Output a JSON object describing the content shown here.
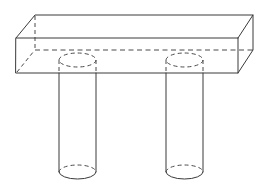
{
  "figure": {
    "type": "orthographic-pictorial-line-drawing",
    "projection": "oblique",
    "background_color": "#ffffff",
    "visible_edge_color": "#3a3a3a",
    "hidden_edge_color": "#4a4a4a",
    "stroke_width": 1,
    "hidden_dash_pattern": "5 3.5",
    "canvas": {
      "width": 264,
      "height": 188
    }
  },
  "geometry": {
    "slab": {
      "name": "rectangular-slab",
      "front_face": {
        "top_left": [
          16,
          38
        ],
        "top_right": [
          238,
          38
        ],
        "bottom_right": [
          238,
          73
        ],
        "bottom_left": [
          16,
          73
        ]
      },
      "depth_offset": [
        19,
        -24
      ],
      "top_face": {
        "front_left": [
          16,
          38
        ],
        "front_right": [
          238,
          38
        ],
        "back_right": [
          253,
          15
        ],
        "back_left": [
          35,
          15
        ]
      },
      "right_end_face": {
        "front_top": [
          238,
          38
        ],
        "back_top": [
          253,
          15
        ],
        "back_bottom": [
          253,
          50
        ],
        "front_bottom": [
          238,
          73
        ]
      },
      "hidden_edges": {
        "back_bottom_horizontal": {
          "from": [
            35,
            50
          ],
          "to": [
            253,
            50
          ]
        },
        "back_left_vertical": {
          "from": [
            35,
            15
          ],
          "to": [
            35,
            50
          ]
        },
        "back_left_diagonal": {
          "from": [
            16,
            73
          ],
          "to": [
            35,
            50
          ]
        }
      },
      "visible_path": "M16,38 L35,15 L253,15 L253,50 L238,73 L16,73 Z"
    },
    "columns": [
      {
        "name": "left-cylinder",
        "left_x": 59,
        "right_x": 96,
        "center_x": 77.5,
        "radius_x": 18.5,
        "top_y": 73,
        "bottom_y": 172,
        "ellipse_radius_y": 7,
        "top_hidden_ellipse_center": [
          77.5,
          60
        ],
        "bottom_ellipse_center": [
          77.5,
          172
        ]
      },
      {
        "name": "right-cylinder",
        "left_x": 166,
        "right_x": 203,
        "center_x": 184.5,
        "radius_x": 18.5,
        "top_y": 73,
        "bottom_y": 172,
        "ellipse_radius_y": 7,
        "top_hidden_ellipse_center": [
          184.5,
          60
        ],
        "bottom_ellipse_center": [
          184.5,
          172
        ]
      }
    ]
  },
  "labels": {
    "slab_label": "",
    "left_column_label": "",
    "right_column_label": "",
    "caption": ""
  }
}
